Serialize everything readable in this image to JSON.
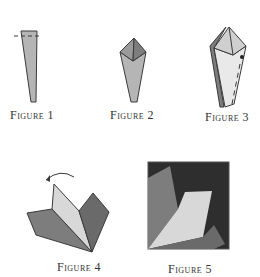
{
  "figures": [
    {
      "id": 1,
      "label": "Figure 1"
    },
    {
      "id": 2,
      "label": "Figure 2"
    },
    {
      "id": 3,
      "label": "Figure 3"
    },
    {
      "id": 4,
      "label": "Figure 4"
    },
    {
      "id": 5,
      "label": "Figure 5"
    }
  ],
  "colors": {
    "outline": "#3a3a3a",
    "light": "#e4e4e4",
    "mid": "#b5b5b5",
    "dark": "#7d7d7d",
    "darker": "#6a6a6a",
    "background_square": "#2e2e2e"
  }
}
